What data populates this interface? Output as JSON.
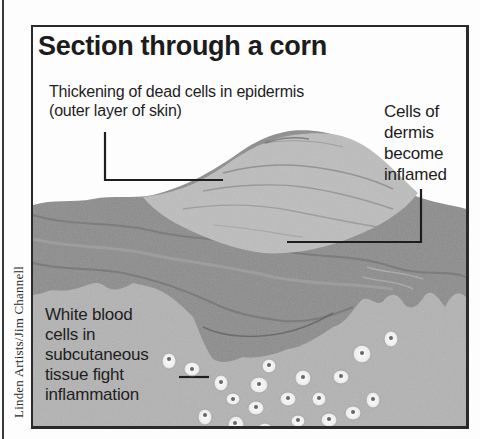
{
  "diagram": {
    "title": "Section through a corn",
    "credit": "Linden Artists/Jim Channell",
    "labels": {
      "epidermis": {
        "line1": "Thickening of dead cells in epidermis",
        "line2": "(outer layer of skin)"
      },
      "dermis": {
        "line1": "Cells of",
        "line2": "dermis",
        "line3": "become",
        "line4": "inflamed"
      },
      "white_blood_cells": {
        "line1": "White blood",
        "line2": "cells in",
        "line3": "subcutaneous",
        "line4": "tissue fight",
        "line5": "inflammation"
      }
    },
    "layers": [
      "epidermis (thickened corn)",
      "dermis",
      "subcutaneous tissue"
    ],
    "colors": {
      "background": "#fdfdfd",
      "epidermis": "#b9b9b9",
      "dermis": "#8a8a8a",
      "subcutaneous": "#b4b4b4",
      "cell": "#f2f2f2",
      "ink": "#1e1e1e"
    }
  }
}
